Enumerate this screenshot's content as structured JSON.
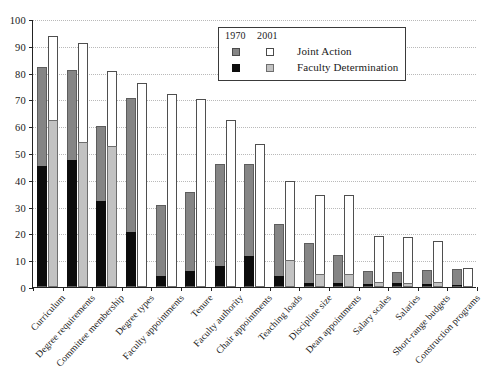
{
  "chart_data": {
    "type": "bar",
    "subtype": "grouped-stacked",
    "title": "",
    "xlabel": "",
    "ylabel": "",
    "ylim": [
      0,
      100
    ],
    "yticks": [
      0,
      10,
      20,
      30,
      40,
      50,
      60,
      70,
      80,
      90,
      100
    ],
    "grid": true,
    "legend_position": "top-right",
    "group_labels": [
      "1970",
      "2001"
    ],
    "categories": [
      "Curriculum",
      "Degree requirements",
      "Committee membership",
      "Degree types",
      "Faculty appointments",
      "Tenure",
      "Faculty authority",
      "Chair appointments",
      "Teaching loads",
      "Discipline size",
      "Dean appointments",
      "Salary scales",
      "Salaries",
      "Short-range budgets",
      "Construction programs"
    ],
    "series": [
      {
        "name": "Faculty Determination",
        "group": "1970",
        "color": "#0d0d0d",
        "values": [
          45,
          47.5,
          32,
          20.5,
          4,
          6,
          8,
          11.5,
          4,
          1.5,
          1.5,
          1,
          1.5,
          1,
          0.5
        ]
      },
      {
        "name": "Joint Action",
        "group": "1970",
        "color": "#858585",
        "values": [
          37,
          33.5,
          28,
          50,
          26.5,
          29.5,
          38,
          34.5,
          19.5,
          15,
          10.5,
          5,
          4,
          5.5,
          6
        ]
      },
      {
        "name": "Faculty Determination",
        "group": "2001",
        "color": "#c2c2c2",
        "values": [
          62.5,
          54,
          52.5,
          0,
          0,
          0,
          0,
          0,
          10,
          5,
          5,
          2,
          1.5,
          2,
          0
        ]
      },
      {
        "name": "Joint Action",
        "group": "2001",
        "color": "#ffffff",
        "values": [
          31,
          37,
          28,
          76,
          72,
          70,
          62.5,
          53.5,
          29.5,
          29.5,
          29.5,
          17,
          17,
          15,
          7
        ]
      }
    ],
    "totals": {
      "1970": [
        82,
        81,
        60,
        70.5,
        30.5,
        35.5,
        46,
        46,
        23.5,
        16.5,
        12,
        6,
        5.5,
        6.5,
        6.5
      ],
      "2001": [
        93.5,
        91,
        80.5,
        76,
        72,
        70,
        62.5,
        53.5,
        39.5,
        34.5,
        34.5,
        19,
        18.5,
        17,
        7
      ]
    }
  },
  "legend": {
    "header_1970": "1970",
    "header_2001": "2001",
    "rows": [
      {
        "label": "Joint Action"
      },
      {
        "label": "Faculty Determination"
      }
    ]
  }
}
